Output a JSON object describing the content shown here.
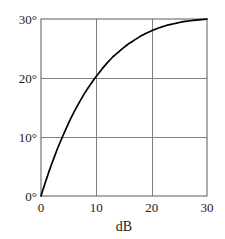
{
  "chart_data": {
    "type": "line",
    "title": "",
    "subtitle": "",
    "xlabel": "dB",
    "ylabel": "",
    "xlim": [
      0,
      30
    ],
    "ylim": [
      0,
      30
    ],
    "grid": true,
    "legend": null,
    "x_ticks": [
      {
        "value": 0,
        "label": "0"
      },
      {
        "value": 10,
        "label": "10"
      },
      {
        "value": 20,
        "label": "20"
      },
      {
        "value": 30,
        "label": "30"
      }
    ],
    "y_ticks": [
      {
        "value": 0,
        "label": "0°"
      },
      {
        "value": 10,
        "label": "10°"
      },
      {
        "value": 20,
        "label": "20°"
      },
      {
        "value": 30,
        "label": "30°"
      }
    ],
    "series": [
      {
        "name": "phase-vs-db",
        "color": "#000000",
        "x": [
          0,
          0.5,
          1,
          1.5,
          2,
          3,
          4,
          5,
          6,
          7,
          8,
          9,
          10,
          11,
          12,
          13,
          14,
          15,
          16,
          17,
          18,
          19,
          20,
          21,
          22,
          23,
          24,
          25,
          26,
          27,
          28,
          29,
          30
        ],
        "values": [
          0.0,
          1.5,
          2.9,
          4.3,
          5.6,
          8.1,
          10.3,
          12.4,
          14.3,
          16.0,
          17.6,
          19.0,
          20.3,
          21.5,
          22.6,
          23.6,
          24.4,
          25.2,
          25.9,
          26.5,
          27.1,
          27.6,
          28.0,
          28.4,
          28.7,
          29.0,
          29.2,
          29.4,
          29.6,
          29.7,
          29.8,
          29.9,
          30.0
        ]
      }
    ],
    "axis_color": "#4d4d4d",
    "grid_color": "#808080",
    "background_color": "#ffffff"
  },
  "geometry": {
    "plot_left": 41,
    "plot_right": 207,
    "plot_top": 19,
    "plot_bottom": 196
  }
}
